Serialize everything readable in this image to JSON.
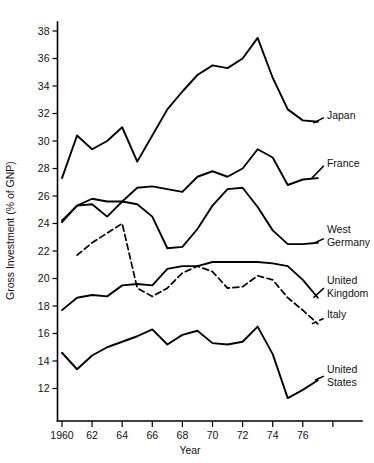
{
  "chart_data": {
    "type": "line",
    "title": "",
    "xlabel": "Year",
    "ylabel": "Gross Investment (% of GNP)",
    "xlim": [
      1960,
      1978
    ],
    "ylim": [
      11,
      38.8
    ],
    "grid": false,
    "legend_position": "right-inline-labels",
    "x_tick_labels": [
      "1960",
      "62",
      "64",
      "66",
      "68",
      "70",
      "72",
      "74",
      "76"
    ],
    "x_tick_values": [
      1960,
      1962,
      1964,
      1966,
      1968,
      1970,
      1972,
      1974,
      1976
    ],
    "x_extra_unlabeled_tick": 1978,
    "y_tick_labels": [
      "12",
      "14",
      "16",
      "18",
      "20",
      "22",
      "24",
      "26",
      "28",
      "30",
      "32",
      "34",
      "36",
      "38"
    ],
    "y_tick_values": [
      12,
      14,
      16,
      18,
      20,
      22,
      24,
      26,
      28,
      30,
      32,
      34,
      36,
      38
    ],
    "x": [
      1960,
      1961,
      1962,
      1963,
      1964,
      1965,
      1966,
      1967,
      1968,
      1969,
      1970,
      1971,
      1972,
      1973,
      1974,
      1975,
      1976,
      1977
    ],
    "series": [
      {
        "name": "Japan",
        "label": "Japan",
        "style": "solid",
        "label_x": 1977.6,
        "label_y": 31.6,
        "leader": {
          "x1": 1976.7,
          "y1": 31.3,
          "x2": 1977.4,
          "y2": 31.7
        },
        "values": [
          27.3,
          30.4,
          29.4,
          30.0,
          31.0,
          28.5,
          30.4,
          32.3,
          33.6,
          34.8,
          35.5,
          35.3,
          36.0,
          37.5,
          34.6,
          32.3,
          31.5,
          31.4
        ]
      },
      {
        "name": "France",
        "label": "France",
        "style": "solid",
        "label_x": 1977.6,
        "label_y": 28.1,
        "leader": {
          "x1": 1976.6,
          "y1": 27.3,
          "x2": 1977.4,
          "y2": 28.2
        },
        "values": [
          24.2,
          25.3,
          25.8,
          25.6,
          25.6,
          26.6,
          26.7,
          26.5,
          26.3,
          27.4,
          27.8,
          27.4,
          28.0,
          29.4,
          28.8,
          26.8,
          27.2,
          27.3
        ]
      },
      {
        "name": "West Germany",
        "label": "West Germany",
        "label_lines": [
          "West",
          "Germany"
        ],
        "style": "solid",
        "label_x": 1977.6,
        "label_y": 23.3,
        "leader": {
          "x1": 1976.8,
          "y1": 22.6,
          "x2": 1977.4,
          "y2": 22.9
        },
        "values": [
          24.1,
          25.3,
          25.4,
          24.5,
          25.6,
          25.4,
          24.5,
          22.2,
          22.3,
          23.6,
          25.3,
          26.5,
          26.6,
          25.2,
          23.5,
          22.5,
          22.5,
          22.6
        ]
      },
      {
        "name": "United Kingdom",
        "label": "United Kingdom",
        "label_lines": [
          "United",
          "Kingdom"
        ],
        "style": "solid",
        "label_x": 1977.6,
        "label_y": 19.6,
        "leader": {
          "x1": 1976.7,
          "y1": 18.6,
          "x2": 1977.4,
          "y2": 19.3
        },
        "values": [
          17.7,
          18.6,
          18.8,
          18.7,
          19.5,
          19.6,
          19.5,
          20.7,
          20.9,
          20.9,
          21.2,
          21.2,
          21.2,
          21.2,
          21.1,
          20.9,
          19.9,
          18.6
        ]
      },
      {
        "name": "Italy",
        "label": "Italy",
        "style": "dashed",
        "label_x": 1977.6,
        "label_y": 17.1,
        "leader": {
          "x1": 1976.6,
          "y1": 16.7,
          "x2": 1977.4,
          "y2": 17.1
        },
        "values": [
          null,
          21.7,
          22.6,
          23.3,
          24.0,
          19.3,
          18.7,
          19.3,
          20.4,
          20.9,
          20.5,
          19.3,
          19.4,
          20.2,
          19.9,
          18.6,
          17.7,
          16.7
        ]
      },
      {
        "name": "United States",
        "label": "United States",
        "label_lines": [
          "United",
          "States"
        ],
        "style": "solid",
        "label_x": 1977.6,
        "label_y": 13.1,
        "leader": {
          "x1": 1976.8,
          "y1": 12.6,
          "x2": 1977.4,
          "y2": 12.9
        },
        "values": [
          14.6,
          13.4,
          14.4,
          15.0,
          15.4,
          15.8,
          16.3,
          15.2,
          15.9,
          16.2,
          15.3,
          15.2,
          15.4,
          16.5,
          14.5,
          11.3,
          11.9,
          12.6
        ]
      }
    ]
  }
}
